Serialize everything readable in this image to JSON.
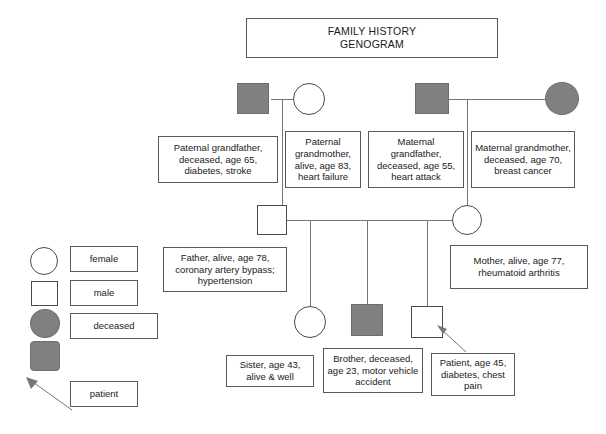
{
  "title": {
    "line1": "FAMILY HISTORY",
    "line2": "GENOGRAM"
  },
  "legend": {
    "items": [
      {
        "label": "female",
        "symbol": "circle-outline-icon"
      },
      {
        "label": "male",
        "symbol": "square-outline-icon"
      },
      {
        "label": "deceased",
        "symbol": "filled-circle-and-square-icon"
      },
      {
        "label": "patient",
        "symbol": "arrow-pointer-icon"
      }
    ]
  },
  "people": {
    "paternal_grandfather": {
      "note": "Paternal grandfather, deceased, age 65, diabetes, stroke",
      "symbol": "square-filled",
      "sex": "male",
      "status": "deceased",
      "age": "65"
    },
    "paternal_grandmother": {
      "note": "Paternal grandmother, alive, age 83, heart failure",
      "symbol": "circle-outline",
      "sex": "female",
      "status": "alive",
      "age": "83"
    },
    "maternal_grandfather": {
      "note": "Maternal grandfather, deceased, age 55, heart attack",
      "symbol": "square-filled",
      "sex": "male",
      "status": "deceased",
      "age": "55"
    },
    "maternal_grandmother": {
      "note": "Maternal grandmother, deceased, age 70, breast cancer",
      "symbol": "circle-filled",
      "sex": "female",
      "status": "deceased",
      "age": "70"
    },
    "father": {
      "note": "Father, alive, age 78, coronary artery bypass; hypertension",
      "symbol": "square-outline",
      "sex": "male",
      "status": "alive",
      "age": "78"
    },
    "mother": {
      "note": "Mother, alive, age 77, rheumatoid arthritis",
      "symbol": "circle-outline",
      "sex": "female",
      "status": "alive",
      "age": "77"
    },
    "sister": {
      "note": "Sister, age 43, alive & well",
      "symbol": "circle-outline",
      "sex": "female",
      "status": "alive",
      "age": "43"
    },
    "brother": {
      "note": "Brother, deceased, age 23, motor vehicle accident",
      "symbol": "square-filled",
      "sex": "male",
      "status": "deceased",
      "age": "23"
    },
    "patient": {
      "note": "Patient, age 45, diabetes, chest pain",
      "symbol": "square-outline",
      "sex": "male",
      "status": "alive",
      "age": "45"
    }
  },
  "colors": {
    "deceased_fill": "#808080",
    "symbol_stroke": "#4a4a4a",
    "line": "#777777",
    "box_border": "#5a5a5a",
    "text": "#1a1a1a"
  }
}
